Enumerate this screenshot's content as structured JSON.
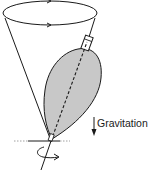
{
  "diagram": {
    "labels": {
      "gravitation": "Gravitation"
    },
    "colors": {
      "stroke": "#1a1a1a",
      "top_fill": "#c8c8c8",
      "background": "#ffffff"
    },
    "elements": [
      "precession-cone",
      "precession-circle-with-arrows",
      "spinning-top-body",
      "spin-axis-dashed",
      "top-stem",
      "ground-line",
      "gravitation-arrow",
      "spin-rotation-arrow"
    ]
  }
}
